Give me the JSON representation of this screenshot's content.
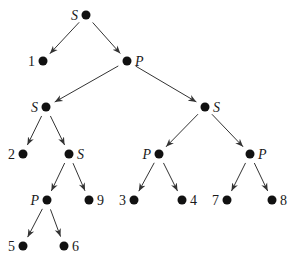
{
  "diagram": {
    "type": "series-parallel decomposition tree",
    "nodes": [
      {
        "id": "n_root",
        "label": "S",
        "x": 86,
        "y": 15,
        "label_side": "left"
      },
      {
        "id": "n_1",
        "label": "1",
        "x": 43,
        "y": 61,
        "label_side": "left"
      },
      {
        "id": "n_P1",
        "label": "P",
        "x": 127,
        "y": 61,
        "label_side": "right"
      },
      {
        "id": "n_S2",
        "label": "S",
        "x": 46,
        "y": 107,
        "label_side": "left"
      },
      {
        "id": "n_S3",
        "label": "S",
        "x": 205,
        "y": 107,
        "label_side": "right"
      },
      {
        "id": "n_2",
        "label": "2",
        "x": 23,
        "y": 154,
        "label_side": "left"
      },
      {
        "id": "n_S4",
        "label": "S",
        "x": 69,
        "y": 154,
        "label_side": "right"
      },
      {
        "id": "n_P2",
        "label": "P",
        "x": 159,
        "y": 154,
        "label_side": "left"
      },
      {
        "id": "n_P3",
        "label": "P",
        "x": 250,
        "y": 154,
        "label_side": "right"
      },
      {
        "id": "n_P4",
        "label": "P",
        "x": 47,
        "y": 200,
        "label_side": "left"
      },
      {
        "id": "n_9",
        "label": "9",
        "x": 89,
        "y": 200,
        "label_side": "right"
      },
      {
        "id": "n_3",
        "label": "3",
        "x": 134,
        "y": 200,
        "label_side": "left"
      },
      {
        "id": "n_4",
        "label": "4",
        "x": 182,
        "y": 200,
        "label_side": "right"
      },
      {
        "id": "n_7",
        "label": "7",
        "x": 227,
        "y": 200,
        "label_side": "left"
      },
      {
        "id": "n_8",
        "label": "8",
        "x": 272,
        "y": 200,
        "label_side": "right"
      },
      {
        "id": "n_5",
        "label": "5",
        "x": 23,
        "y": 246,
        "label_side": "left"
      },
      {
        "id": "n_6",
        "label": "6",
        "x": 64,
        "y": 246,
        "label_side": "right"
      }
    ],
    "edges": [
      [
        "n_root",
        "n_1"
      ],
      [
        "n_root",
        "n_P1"
      ],
      [
        "n_P1",
        "n_S2"
      ],
      [
        "n_P1",
        "n_S3"
      ],
      [
        "n_S2",
        "n_2"
      ],
      [
        "n_S2",
        "n_S4"
      ],
      [
        "n_S3",
        "n_P2"
      ],
      [
        "n_S3",
        "n_P3"
      ],
      [
        "n_S4",
        "n_P4"
      ],
      [
        "n_S4",
        "n_9"
      ],
      [
        "n_P2",
        "n_3"
      ],
      [
        "n_P2",
        "n_4"
      ],
      [
        "n_P3",
        "n_7"
      ],
      [
        "n_P3",
        "n_8"
      ],
      [
        "n_P4",
        "n_5"
      ],
      [
        "n_P4",
        "n_6"
      ]
    ],
    "colors": {
      "node": "#111111",
      "edge": "#333333",
      "text": "#1a1a1a"
    }
  }
}
